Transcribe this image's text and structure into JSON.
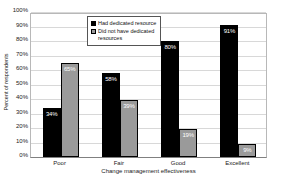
{
  "chart_data": {
    "type": "bar",
    "title": "",
    "categories": [
      "Poor",
      "Fair",
      "Good",
      "Excellent"
    ],
    "series": [
      {
        "name": "Had dedicated resource",
        "color": "#000000",
        "values": [
          34,
          58,
          80,
          91
        ],
        "labels": [
          "34%",
          "58%",
          "80%",
          "91%"
        ]
      },
      {
        "name": "Did not have dedicated resources",
        "color": "#9a9a9a",
        "values": [
          65,
          39,
          19,
          9
        ],
        "labels": [
          "65%",
          "39%",
          "19%",
          "9%"
        ]
      }
    ],
    "xlabel": "Change management effectiveness",
    "ylabel": "Percent of respondents",
    "ylim": [
      0,
      100
    ],
    "ytick_step": 10,
    "ytick_labels": [
      "0%",
      "10%",
      "20%",
      "30%",
      "40%",
      "50%",
      "60%",
      "70%",
      "80%",
      "90%",
      "100%"
    ],
    "grid": "horizontal",
    "legend_position": "top-inside-left-of-center",
    "bar_label_color": "#ffffff",
    "gridline_color": "#d8d8d8"
  }
}
